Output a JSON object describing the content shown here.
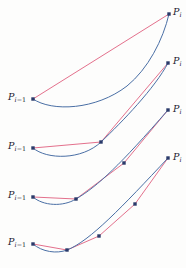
{
  "figure": {
    "width": 186,
    "height": 268,
    "background_color": "#fdfdfc"
  },
  "colors": {
    "curve": "#4a6fa5",
    "polygon": "#e0607f",
    "point": "#2a3a6a",
    "label": "#1a1a2e"
  },
  "style": {
    "curve_width": 1.0,
    "polygon_width": 0.9,
    "point_radius": 1.7
  },
  "labels": {
    "start_symbol": "P",
    "start_sub_index": "i",
    "start_sub_op": "−1",
    "end_symbol": "P",
    "end_sub_index": "i"
  },
  "chart_data": {
    "type": "line",
    "xlabel": "",
    "ylabel": "",
    "xlim": [
      0,
      186
    ],
    "ylim": [
      268,
      0
    ],
    "grid": false,
    "legend": "none",
    "annotations": [
      {
        "text": "P_{i-1}",
        "row": 1,
        "x": 8,
        "y": 97,
        "align": "left"
      },
      {
        "text": "P_i",
        "row": 1,
        "x": 172,
        "y": 11,
        "align": "right"
      },
      {
        "text": "P_{i-1}",
        "row": 2,
        "x": 8,
        "y": 145,
        "align": "left"
      },
      {
        "text": "P_i",
        "row": 2,
        "x": 172,
        "y": 60,
        "align": "right"
      },
      {
        "text": "P_{i-1}",
        "row": 3,
        "x": 8,
        "y": 195,
        "align": "left"
      },
      {
        "text": "P_i",
        "row": 3,
        "x": 172,
        "y": 108,
        "align": "right"
      },
      {
        "text": "P_{i-1}",
        "row": 4,
        "x": 8,
        "y": 241,
        "align": "left"
      },
      {
        "text": "P_i",
        "row": 4,
        "x": 172,
        "y": 156,
        "align": "right"
      }
    ],
    "series": [
      {
        "name": "row-1-curve",
        "kind": "curve",
        "color": "#4a6fa5",
        "path": "M 33 99 C 52 112, 96 110, 127 86 C 148 69, 163 40, 169 14",
        "x": [
          33,
          60,
          90,
          118,
          143,
          160,
          169
        ],
        "y": [
          99,
          108,
          106,
          93,
          68,
          40,
          14
        ]
      },
      {
        "name": "row-1-polygon",
        "kind": "polygon",
        "color": "#e0607f",
        "points": [
          [
            33,
            99
          ],
          [
            169,
            14
          ]
        ],
        "x": [
          33,
          169
        ],
        "y": [
          99,
          14
        ]
      },
      {
        "name": "row-1-points",
        "kind": "points",
        "color": "#2a3a6a",
        "points": [
          [
            33,
            99
          ],
          [
            169,
            14
          ]
        ]
      },
      {
        "name": "row-2-curve",
        "kind": "curve",
        "color": "#4a6fa5",
        "path": "M 33 148 C 47 160, 82 160, 101 142 C 122 122, 155 88, 168 63",
        "x": [
          33,
          55,
          78,
          101,
          128,
          152,
          168
        ],
        "y": [
          148,
          157,
          156,
          142,
          119,
          87,
          63
        ]
      },
      {
        "name": "row-2-polygon",
        "kind": "polygon",
        "color": "#e0607f",
        "points": [
          [
            33,
            148
          ],
          [
            101,
            142
          ],
          [
            168,
            63
          ]
        ],
        "x": [
          33,
          101,
          168
        ],
        "y": [
          148,
          142,
          63
        ]
      },
      {
        "name": "row-2-points",
        "kind": "points",
        "color": "#2a3a6a",
        "points": [
          [
            33,
            148
          ],
          [
            101,
            142
          ],
          [
            168,
            63
          ]
        ]
      },
      {
        "name": "row-3-curve",
        "kind": "curve",
        "color": "#4a6fa5",
        "path": "M 33 197 C 43 206, 63 207, 76 199 C 98 186, 120 165, 168 110",
        "x": [
          33,
          50,
          63,
          76,
          105,
          125,
          147,
          168
        ],
        "y": [
          197,
          205,
          206,
          199,
          180,
          162,
          138,
          110
        ]
      },
      {
        "name": "row-3-polygon",
        "kind": "polygon",
        "color": "#e0607f",
        "points": [
          [
            33,
            197
          ],
          [
            76,
            199
          ],
          [
            124,
            163
          ],
          [
            168,
            110
          ]
        ],
        "x": [
          33,
          76,
          124,
          168
        ],
        "y": [
          197,
          199,
          163,
          110
        ]
      },
      {
        "name": "row-3-points",
        "kind": "points",
        "color": "#2a3a6a",
        "points": [
          [
            33,
            197
          ],
          [
            76,
            199
          ],
          [
            124,
            163
          ],
          [
            168,
            110
          ]
        ]
      },
      {
        "name": "row-4-curve",
        "kind": "curve",
        "color": "#4a6fa5",
        "path": "M 33 244 C 42 252, 57 254, 67 250 C 90 241, 122 207, 168 158",
        "x": [
          33,
          48,
          58,
          67,
          99,
          124,
          146,
          168
        ],
        "y": [
          244,
          251,
          253,
          250,
          236,
          215,
          189,
          158
        ]
      },
      {
        "name": "row-4-polygon",
        "kind": "polygon",
        "color": "#e0607f",
        "points": [
          [
            33,
            244
          ],
          [
            67,
            250
          ],
          [
            99,
            236
          ],
          [
            135,
            204
          ],
          [
            168,
            158
          ]
        ],
        "x": [
          33,
          67,
          99,
          135,
          168
        ],
        "y": [
          244,
          250,
          236,
          204,
          158
        ]
      },
      {
        "name": "row-4-points",
        "kind": "points",
        "color": "#2a3a6a",
        "points": [
          [
            33,
            244
          ],
          [
            67,
            250
          ],
          [
            99,
            236
          ],
          [
            135,
            204
          ],
          [
            168,
            158
          ]
        ]
      }
    ]
  }
}
